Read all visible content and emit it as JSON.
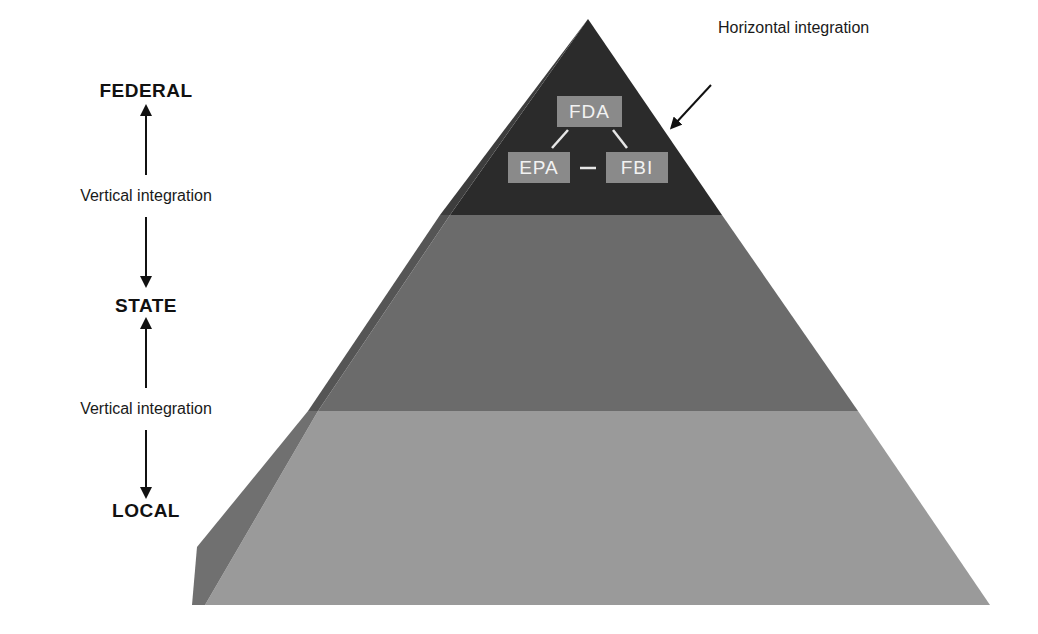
{
  "levels": {
    "federal": "FEDERAL",
    "state": "STATE",
    "local": "LOCAL"
  },
  "vertical_integration": {
    "upper": "Vertical integration",
    "lower": "Vertical integration"
  },
  "horizontal_integration": "Horizontal integration",
  "agencies": {
    "top": "FDA",
    "left": "EPA",
    "right": "FBI"
  },
  "colors": {
    "tier_federal": "#2b2b2b",
    "tier_state": "#6b6b6b",
    "tier_local": "#9a9a9a",
    "side_face_dark": "#3d3d3d",
    "side_face_mid": "#555555",
    "side_face_light": "#707070",
    "agency_box": "#8a8a8a",
    "agency_text": "#f2f2f2",
    "text": "#111111"
  }
}
